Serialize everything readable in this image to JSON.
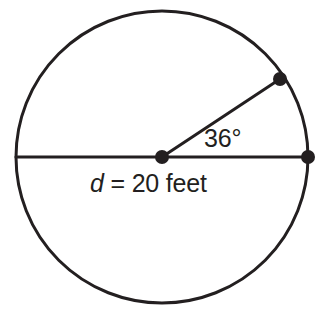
{
  "figure": {
    "kind": "circle-geometry-diagram",
    "background_color": "#ffffff",
    "stroke_color": "#231f20",
    "text_color": "#231f20",
    "labels": {
      "angle": "36°",
      "diameter_variable": "d",
      "diameter_equals": "=",
      "diameter_value": "20 feet",
      "diameter_full": "d = 20 feet"
    },
    "geometry": {
      "center": {
        "x": 162,
        "y": 157
      },
      "radius": 146,
      "circle_stroke_width": 3,
      "diameter_line": {
        "x1": 16,
        "y1": 157,
        "x2": 308,
        "y2": 157,
        "stroke_width": 3
      },
      "radius_line": {
        "x1": 162,
        "y1": 157,
        "x2": 280,
        "y2": 79,
        "stroke_width": 3,
        "angle_degrees": 36
      },
      "points": [
        {
          "name": "center-point",
          "x": 162,
          "y": 157,
          "r": 7
        },
        {
          "name": "right-diameter-endpoint",
          "x": 308,
          "y": 157,
          "r": 7
        },
        {
          "name": "radius-arc-endpoint",
          "x": 280,
          "y": 79,
          "r": 7
        }
      ]
    }
  }
}
